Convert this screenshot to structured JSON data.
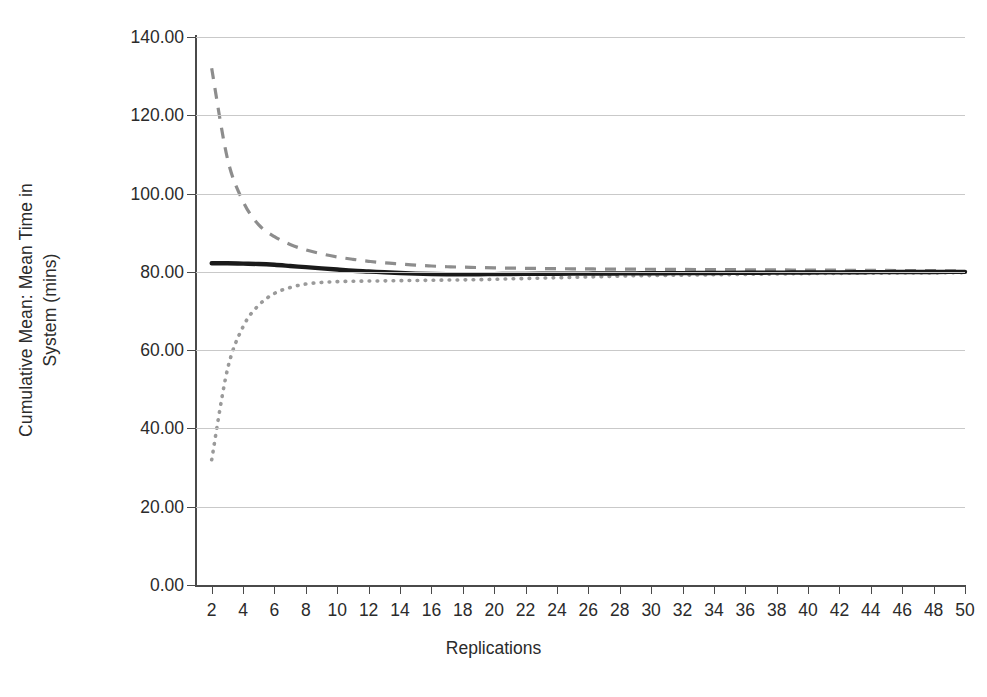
{
  "chart_data": {
    "type": "line",
    "title": "",
    "xlabel": "Replications",
    "ylabel_line1": "Cumulative Mean: Mean Time in",
    "ylabel_line2": "System (mins)",
    "ylabel": "Cumulative Mean: Mean Time in System (mins)",
    "xlim": [
      1,
      50
    ],
    "ylim": [
      0,
      140
    ],
    "ytick_labels": [
      "0.00",
      "20.00",
      "40.00",
      "60.00",
      "80.00",
      "100.00",
      "120.00",
      "140.00"
    ],
    "ytick_values": [
      0,
      20,
      40,
      60,
      80,
      100,
      120,
      140
    ],
    "xtick_labels": [
      "2",
      "4",
      "6",
      "8",
      "10",
      "12",
      "14",
      "16",
      "18",
      "20",
      "22",
      "24",
      "26",
      "28",
      "30",
      "32",
      "34",
      "36",
      "38",
      "40",
      "42",
      "44",
      "46",
      "48",
      "50"
    ],
    "xtick_values": [
      2,
      4,
      6,
      8,
      10,
      12,
      14,
      16,
      18,
      20,
      22,
      24,
      26,
      28,
      30,
      32,
      34,
      36,
      38,
      40,
      42,
      44,
      46,
      48,
      50
    ],
    "grid": "horizontal",
    "legend": "none",
    "x": [
      2,
      3,
      4,
      5,
      6,
      7,
      8,
      9,
      10,
      11,
      12,
      13,
      14,
      15,
      16,
      17,
      18,
      19,
      20,
      21,
      22,
      23,
      24,
      25,
      26,
      27,
      28,
      29,
      30,
      31,
      32,
      33,
      34,
      35,
      36,
      37,
      38,
      39,
      40,
      41,
      42,
      43,
      44,
      45,
      46,
      47,
      48,
      49,
      50
    ],
    "series": [
      {
        "name": "Upper 95% confidence limit",
        "style": "dashed",
        "color": "#8d8d8d",
        "values": [
          132.0,
          109.0,
          98.0,
          92.0,
          89.0,
          87.0,
          85.6,
          84.6,
          83.8,
          83.2,
          82.7,
          82.3,
          82.0,
          81.7,
          81.5,
          81.3,
          81.2,
          81.1,
          81.0,
          80.95,
          80.9,
          80.85,
          80.8,
          80.78,
          80.75,
          80.72,
          80.7,
          80.68,
          80.66,
          80.64,
          80.62,
          80.6,
          80.58,
          80.56,
          80.54,
          80.52,
          80.5,
          80.48,
          80.46,
          80.44,
          80.42,
          80.4,
          80.38,
          80.36,
          80.34,
          80.32,
          80.3,
          80.28,
          80.26
        ]
      },
      {
        "name": "Cumulative mean",
        "style": "solid",
        "color": "#1a1a1a",
        "values": [
          82.2,
          82.2,
          82.1,
          82.0,
          81.8,
          81.5,
          81.2,
          80.9,
          80.6,
          80.3,
          80.1,
          79.9,
          79.7,
          79.55,
          79.45,
          79.4,
          79.4,
          79.4,
          79.42,
          79.45,
          79.48,
          79.5,
          79.52,
          79.54,
          79.56,
          79.58,
          79.6,
          79.62,
          79.64,
          79.66,
          79.68,
          79.7,
          79.72,
          79.74,
          79.76,
          79.78,
          79.8,
          79.82,
          79.84,
          79.86,
          79.88,
          79.9,
          79.92,
          79.94,
          79.96,
          79.97,
          79.98,
          79.99,
          80.0
        ]
      },
      {
        "name": "Lower 95% confidence limit",
        "style": "dotted",
        "color": "#9a9a9a",
        "values": [
          32.0,
          55.0,
          66.0,
          71.5,
          74.5,
          76.0,
          76.9,
          77.3,
          77.5,
          77.6,
          77.65,
          77.7,
          77.75,
          77.8,
          77.85,
          77.9,
          77.95,
          78.0,
          78.1,
          78.2,
          78.3,
          78.4,
          78.5,
          78.6,
          78.7,
          78.8,
          78.9,
          79.0,
          79.05,
          79.1,
          79.15,
          79.2,
          79.25,
          79.3,
          79.35,
          79.4,
          79.45,
          79.5,
          79.55,
          79.6,
          79.62,
          79.64,
          79.66,
          79.68,
          79.7,
          79.72,
          79.74,
          79.76,
          79.78
        ]
      }
    ]
  }
}
